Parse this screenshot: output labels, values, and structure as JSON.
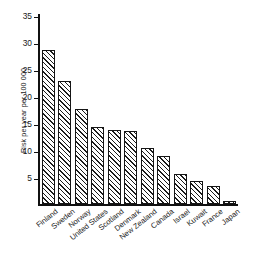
{
  "chart_data": {
    "type": "bar",
    "title": "",
    "xlabel": "",
    "ylabel": "Risk per year per 100 000",
    "ylim": [
      0,
      35
    ],
    "yticks": [
      5,
      10,
      15,
      20,
      25,
      30,
      35
    ],
    "ytick_labels": [
      "5",
      "10",
      "15",
      "20",
      "25",
      "30",
      "35"
    ],
    "grid": false,
    "legend": "none",
    "categories": [
      "Finland",
      "Sweden",
      "Norway",
      "United States",
      "Scotland",
      "Denmark",
      "New Zealand",
      "Canada",
      "Israel",
      "Kuwait",
      "France",
      "Japan"
    ],
    "values": [
      28.4,
      22.6,
      17.4,
      14.1,
      13.6,
      13.4,
      10.2,
      8.7,
      5.4,
      4.1,
      3.3,
      0.5
    ],
    "bar_fill": "diagonal-hatch",
    "bar_edge_color": "#151515",
    "bar_hatch_color": "#1b1b1b",
    "axis_color": "#111111"
  },
  "caption": {
    "text": ""
  }
}
